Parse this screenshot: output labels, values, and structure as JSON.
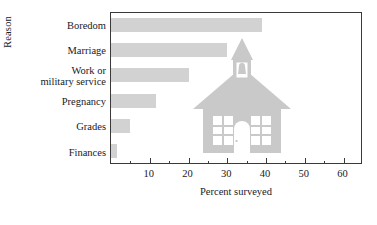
{
  "chart_data": {
    "type": "bar",
    "orientation": "horizontal",
    "title": "",
    "xlabel": "Percent surveyed",
    "ylabel": "Reason",
    "categories": [
      "Boredom",
      "Marriage",
      "Work or\nmilitary service",
      "Pregnancy",
      "Grades",
      "Finances"
    ],
    "values": [
      39,
      30,
      20,
      11.5,
      4.8,
      1.5
    ],
    "xlim": [
      0,
      65
    ],
    "ylim": [
      0,
      6
    ],
    "xticks": [
      10,
      20,
      30,
      40,
      50,
      60
    ],
    "xtick_labels": [
      "10",
      "20",
      "30",
      "40",
      "50",
      "60"
    ],
    "xminor_ticks": [
      5,
      15,
      25,
      35,
      45,
      55
    ],
    "grid": false,
    "legend": null,
    "bar_color": "#d2d2d2",
    "frame_color": "#3a3a3a",
    "watermark": "schoolhouse-illustration"
  },
  "axes": {
    "y_title": "Reason",
    "x_title": "Percent surveyed"
  },
  "colors": {
    "bar": "#d2d2d2",
    "frame": "#3a3a3a",
    "text": "#20201f",
    "watermark": "#c9c9c9",
    "background": "#ffffff"
  }
}
